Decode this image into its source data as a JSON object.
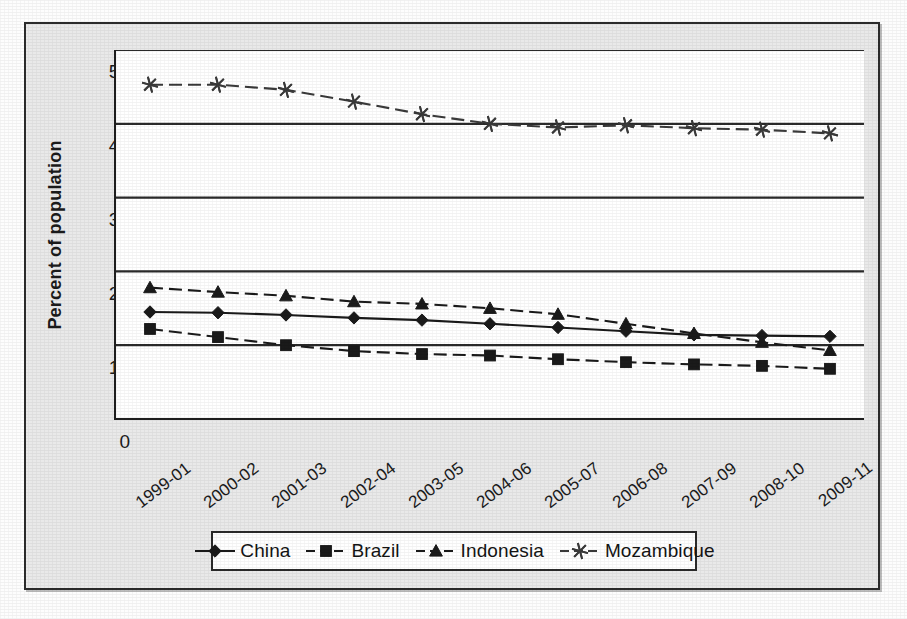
{
  "page": {
    "cutoff_text_fragment": "ation living on less than $1.25 a day"
  },
  "legend": {
    "position": "bottom",
    "items": [
      {
        "label": "China",
        "marker": "diamond",
        "color": "#1a1a1a",
        "line_style": "solid"
      },
      {
        "label": "Brazil",
        "marker": "square",
        "color": "#1a1a1a",
        "line_style": "dashed"
      },
      {
        "label": "Indonesia",
        "marker": "triangle",
        "color": "#1a1a1a",
        "line_style": "dashed"
      },
      {
        "label": "Mozambique",
        "marker": "asterisk",
        "color": "#3a3a3a",
        "line_style": "dashed"
      }
    ]
  },
  "axes": {
    "y_title": "Percent of population",
    "y_ticks": [
      "0",
      "10",
      "20",
      "30",
      "40",
      "50"
    ],
    "x_ticks": [
      "1999-01",
      "2000-02",
      "2001-03",
      "2002-04",
      "2003-05",
      "2004-06",
      "2005-07",
      "2006-08",
      "2007-09",
      "2008-10",
      "2009-11"
    ]
  },
  "chart_data": {
    "type": "line",
    "title": "",
    "subtitle": "",
    "xlabel": "",
    "ylabel": "Percent of population",
    "ylim": [
      0,
      50
    ],
    "ytick_step": 10,
    "grid": "horizontal",
    "legend_position": "bottom",
    "x": [
      "1999-01",
      "2000-02",
      "2001-03",
      "2002-04",
      "2003-05",
      "2004-06",
      "2005-07",
      "2006-08",
      "2007-09",
      "2008-10",
      "2009-11"
    ],
    "categories": [
      "1999-01",
      "2000-02",
      "2001-03",
      "2002-04",
      "2003-05",
      "2004-06",
      "2005-07",
      "2006-08",
      "2007-09",
      "2008-10",
      "2009-11"
    ],
    "series": [
      {
        "name": "Mozambique",
        "marker": "asterisk",
        "line_style": "dashed",
        "color": "#3a3a3a",
        "values": [
          45.3,
          45.3,
          44.6,
          43.0,
          41.3,
          40.0,
          39.5,
          39.8,
          39.4,
          39.2,
          38.7
        ]
      },
      {
        "name": "Indonesia",
        "marker": "triangle",
        "line_style": "dashed",
        "color": "#1a1a1a",
        "values": [
          17.8,
          17.2,
          16.7,
          15.9,
          15.6,
          15.0,
          14.2,
          12.9,
          11.6,
          10.4,
          9.3
        ]
      },
      {
        "name": "China",
        "marker": "diamond",
        "line_style": "solid",
        "color": "#1a1a1a",
        "values": [
          14.5,
          14.4,
          14.1,
          13.7,
          13.4,
          12.9,
          12.4,
          11.9,
          11.4,
          11.3,
          11.2
        ]
      },
      {
        "name": "Brazil",
        "marker": "square",
        "line_style": "dashed",
        "color": "#1a1a1a",
        "values": [
          12.2,
          11.1,
          10.0,
          9.2,
          8.8,
          8.6,
          8.1,
          7.7,
          7.4,
          7.2,
          6.8
        ]
      }
    ]
  }
}
